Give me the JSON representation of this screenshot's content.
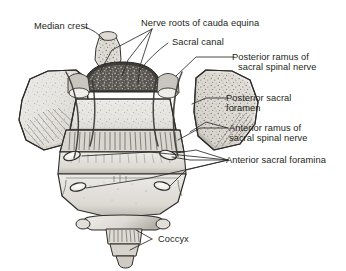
{
  "figure": {
    "style": "grayscale pen-and-ink anatomical illustration",
    "background_color": "#ffffff",
    "label_text_color": "#231f20",
    "leader_line_color": "#2a2a2a",
    "bone_fill_light": "#e8e6e2",
    "bone_fill_mid": "#cfccc6",
    "bone_shadow": "#6f6c67",
    "canal_dark": "#3a3835"
  },
  "labels": {
    "median_crest": "Median crest",
    "nerve_roots": "Nerve roots of cauda equina",
    "sacral_canal": "Sacral canal",
    "posterior_ramus_line1": "Posterior ramus of",
    "posterior_ramus_line2": "sacral spinal nerve",
    "posterior_foramen_line1": "Posterior sacral",
    "posterior_foramen_line2": "foramen",
    "anterior_ramus_line1": "Anterior ramus of",
    "anterior_ramus_line2": "sacral spinal nerve",
    "anterior_foramina": "Anterior sacral foramina",
    "coccyx": "Coccyx"
  }
}
